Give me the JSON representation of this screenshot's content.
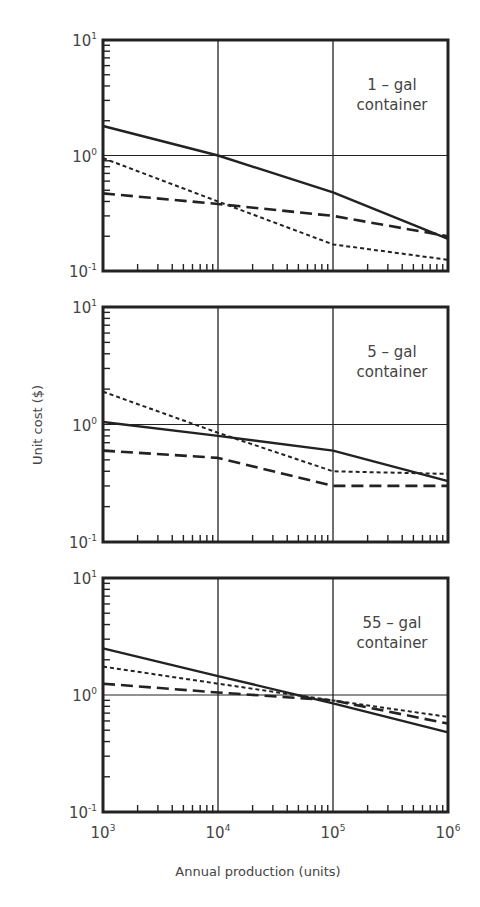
{
  "chart_data": {
    "type": "line",
    "scale": "log-log",
    "xlabel": "Annual production (units)",
    "ylabel": "Unit cost ($)",
    "x": [
      1000,
      10000,
      100000,
      1000000
    ],
    "x_tick_labels": [
      {
        "base": "10",
        "exp": "3"
      },
      {
        "base": "10",
        "exp": "4"
      },
      {
        "base": "10",
        "exp": "5"
      },
      {
        "base": "10",
        "exp": "6"
      }
    ],
    "y_tick_labels": [
      {
        "base": "10",
        "exp": "1"
      },
      {
        "base": "10",
        "exp": "0"
      },
      {
        "base": "10",
        "exp": "-1"
      }
    ],
    "xlim": [
      1000,
      1000000
    ],
    "ylim": [
      0.1,
      10
    ],
    "grid": "major decades only",
    "legend": "none (series distinguished by line style)",
    "panels": [
      {
        "label_line1": "1 – gal",
        "label_line2": "container",
        "series": [
          {
            "name": "solid",
            "style": "solid",
            "values": [
              1.8,
              1.0,
              0.48,
              0.19
            ]
          },
          {
            "name": "short-dashed",
            "style": "dotted",
            "values": [
              0.95,
              0.4,
              0.17,
              0.125
            ]
          },
          {
            "name": "long-dashed",
            "style": "dashed",
            "values": [
              0.47,
              0.38,
              0.3,
              0.2
            ]
          }
        ]
      },
      {
        "label_line1": "5 – gal",
        "label_line2": "container",
        "series": [
          {
            "name": "solid",
            "style": "solid",
            "values": [
              1.05,
              0.8,
              0.6,
              0.33
            ]
          },
          {
            "name": "short-dashed",
            "style": "dotted",
            "values": [
              1.9,
              0.85,
              0.4,
              0.38
            ]
          },
          {
            "name": "long-dashed",
            "style": "dashed",
            "values": [
              0.6,
              0.52,
              0.3,
              0.3
            ]
          }
        ]
      },
      {
        "label_line1": "55 – gal",
        "label_line2": "container",
        "series": [
          {
            "name": "solid",
            "style": "solid",
            "values": [
              2.5,
              1.45,
              0.85,
              0.48
            ]
          },
          {
            "name": "short-dashed",
            "style": "dotted",
            "values": [
              1.75,
              1.25,
              0.9,
              0.65
            ]
          },
          {
            "name": "long-dashed",
            "style": "dashed",
            "values": [
              1.25,
              1.05,
              0.9,
              0.57
            ]
          }
        ]
      }
    ]
  },
  "colors": {
    "ink": "#222222",
    "text": "#444444",
    "background": "#ffffff"
  }
}
